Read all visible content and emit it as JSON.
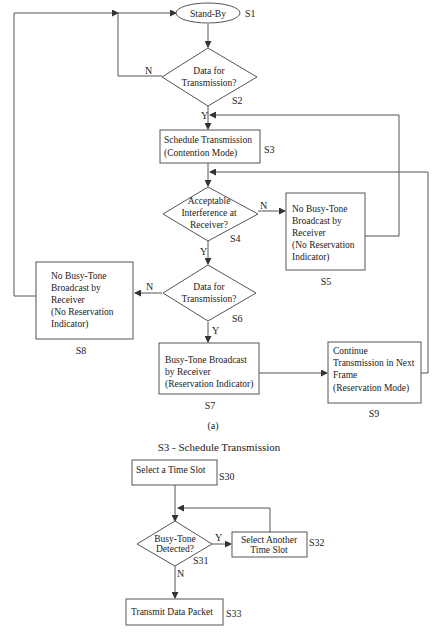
{
  "figure_a": {
    "caption": "(a)",
    "nodes": {
      "s1": {
        "id": "S1",
        "lines": [
          "Stand-By"
        ]
      },
      "s2": {
        "id": "S2",
        "lines": [
          "Data for",
          "Transmission?"
        ]
      },
      "s3": {
        "id": "S3",
        "lines": [
          "Schedule Transmission",
          "(Contention Mode)"
        ]
      },
      "s4": {
        "id": "S4",
        "lines": [
          "Acceptable",
          "Interference at",
          "Receiver?"
        ]
      },
      "s5": {
        "id": "S5",
        "lines": [
          "No Busy-Tone",
          "Broadcast by",
          "Receiver",
          "(No Reservation",
          "Indicator)"
        ]
      },
      "s6": {
        "id": "S6",
        "lines": [
          "Data for",
          "Transmission?"
        ]
      },
      "s7": {
        "id": "S7",
        "lines": [
          "Busy-Tone Broadcast",
          "by Receiver",
          "(Reservation Indicator)"
        ]
      },
      "s8": {
        "id": "S8",
        "lines": [
          "No Busy-Tone",
          "Broadcast by",
          "Receiver",
          "(No Reservation",
          "Indicator)"
        ]
      },
      "s9": {
        "id": "S9",
        "lines": [
          "Continue",
          "Transmission in Next",
          "Frame",
          "(Reservation Mode)"
        ]
      }
    },
    "edge_labels": {
      "s2_no": "N",
      "s2_yes": "Y",
      "s4_no": "N",
      "s4_yes": "Y",
      "s6_no": "N",
      "s6_yes": "Y"
    }
  },
  "figure_b": {
    "title": "S3 - Schedule Transmission",
    "nodes": {
      "s30": {
        "id": "S30",
        "lines": [
          "Select a Time Slot"
        ]
      },
      "s31": {
        "id": "S31",
        "lines": [
          "Busy-Tone",
          "Detected?"
        ]
      },
      "s32": {
        "id": "S32",
        "lines": [
          "Select Another",
          "Time Slot"
        ]
      },
      "s33": {
        "id": "S33",
        "lines": [
          "Transmit Data Packet"
        ]
      }
    },
    "edge_labels": {
      "s31_yes": "Y",
      "s31_no": "N"
    }
  }
}
